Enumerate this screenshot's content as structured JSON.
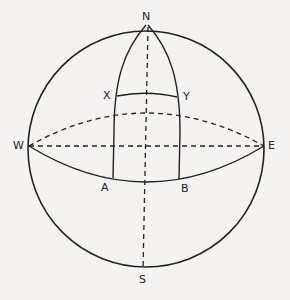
{
  "diagram": {
    "title": "",
    "colors": {
      "line": "#222222",
      "background": "#f4f3f1"
    },
    "sphere": {
      "cx": 146,
      "cy": 149,
      "r": 118
    },
    "points": {
      "north": {
        "label": "N",
        "x": 148,
        "y": 25
      },
      "south": {
        "label": "S",
        "x": 143,
        "y": 272
      },
      "west": {
        "label": "W",
        "x": 29,
        "y": 146
      },
      "east": {
        "label": "E",
        "x": 264,
        "y": 146
      },
      "x": {
        "label": "X",
        "x": 117,
        "y": 96
      },
      "y": {
        "label": "Y",
        "x": 177,
        "y": 97
      },
      "a": {
        "label": "A",
        "x": 115,
        "y": 175
      },
      "b": {
        "label": "B",
        "x": 177,
        "y": 176
      }
    },
    "elements": [
      "outer circle (sphere outline)",
      "equator: front arc solid, back arc dashed",
      "dashed diameter W–E",
      "dashed axis N–S",
      "two meridians from N through X/A and Y/B",
      "arc X–Y parallel to equator"
    ]
  }
}
